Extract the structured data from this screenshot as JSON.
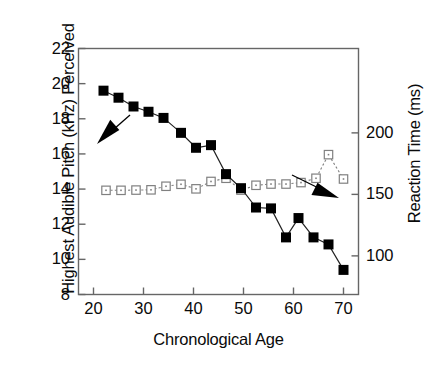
{
  "chart_data": {
    "type": "line",
    "title": "",
    "xlabel": "Chronological Age",
    "ylabel": "Highest Audible Pitch (kHz) Perceived",
    "ylabel_right": "Reaction Time (ms)",
    "xlim": [
      17,
      73
    ],
    "ylim": [
      8,
      22
    ],
    "ylim_right": [
      68.6,
      268.6
    ],
    "xticks": [
      20,
      30,
      40,
      50,
      60,
      70
    ],
    "xtick_labels": [
      "20",
      "30",
      "40",
      "50",
      "60",
      "70"
    ],
    "yticks": [
      8,
      10,
      12,
      14,
      16,
      18,
      20,
      22
    ],
    "ytick_labels": [
      "8",
      "10",
      "12",
      "14",
      "16",
      "18",
      "20",
      "22"
    ],
    "yticks_right": [
      100,
      150,
      200
    ],
    "ytick_labels_right": [
      "100",
      "150",
      "200"
    ],
    "grid": false,
    "legend": "none",
    "annotations": [
      {
        "name": "arrow-to-pitch-series",
        "description": "filled arrow pointing down-left toward the solid-square pitch curve",
        "x1": 130,
        "y1": 115,
        "x2": 97,
        "y2": 144
      },
      {
        "name": "arrow-to-reaction-series",
        "description": "filled arrow pointing down-right toward the open-square reaction-time curve",
        "x1": 292,
        "y1": 175,
        "x2": 339,
        "y2": 198
      }
    ],
    "series": [
      {
        "name": "Highest Audible Pitch (kHz) Perceived",
        "axis": "left",
        "marker": "filled-square",
        "color": "#000000",
        "linestyle": "solid",
        "x": [
          22,
          25,
          28,
          31,
          34,
          37.5,
          40.5,
          43.5,
          46.5,
          49.5,
          52.5,
          55.5,
          58.5,
          61,
          64,
          67,
          70
        ],
        "y": [
          19.6,
          19.2,
          18.7,
          18.4,
          18.05,
          17.2,
          16.35,
          16.5,
          14.85,
          14.05,
          12.95,
          12.9,
          11.25,
          12.35,
          11.25,
          10.85,
          9.4
        ]
      },
      {
        "name": "Reaction Time (ms)",
        "axis": "right",
        "marker": "open-square",
        "color": "#808080",
        "linestyle": "dotted",
        "x": [
          22.5,
          25.5,
          28.5,
          31.5,
          34.5,
          37.5,
          40.5,
          43.5,
          46.5,
          49.5,
          52.5,
          55.5,
          58.5,
          61.5,
          64.5,
          67,
          70
        ],
        "y_right": [
          153.3,
          153.3,
          153.5,
          153.7,
          156.6,
          158.2,
          154.5,
          160.5,
          163.1,
          153.5,
          157.4,
          158.4,
          158.4,
          159.6,
          163.1,
          182.3,
          162.5
        ],
        "y_left_equivalent": [
          15.3,
          15.3,
          15.32,
          15.35,
          15.55,
          15.95,
          15.5,
          16.35,
          16.35,
          15.3,
          15.65,
          15.75,
          15.75,
          15.9,
          16.25,
          17.65,
          16.0
        ]
      }
    ]
  },
  "axes": {
    "frame_color": "#555555"
  }
}
